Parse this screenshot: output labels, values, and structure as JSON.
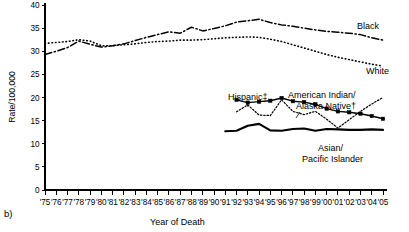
{
  "panel": {
    "label": "b)"
  },
  "axes": {
    "y_title": "Rate/100,000",
    "x_title": "Year of Death",
    "y_ticks": [
      "0",
      "5",
      "10",
      "15",
      "20",
      "25",
      "30",
      "35",
      "40"
    ],
    "x_ticks": [
      "'75",
      "'76",
      "'77",
      "'78",
      "'79",
      "'80",
      "'81",
      "'82",
      "'83",
      "'84",
      "'85",
      "'86",
      "'87",
      "'88",
      "'89",
      "'90",
      "'91",
      "'92",
      "'93",
      "'94",
      "'95",
      "'96",
      "'97",
      "'98",
      "'99",
      "'00",
      "'01",
      "'02",
      "'03",
      "'04",
      "'05"
    ]
  },
  "labels": {
    "black": "Black",
    "white": "White",
    "hispanic": "Hispanic‡",
    "aian_line1": "American Indian/",
    "aian_line2": "Alaska Native†",
    "api_line1": "Asian/",
    "api_line2": "Pacific Islander"
  },
  "colors": {
    "ink": "#000000",
    "background": "#ffffff"
  },
  "chart_data": {
    "type": "line",
    "title": "",
    "xlabel": "Year of Death",
    "ylabel": "Rate/100,000",
    "xlim": [
      1975,
      2005
    ],
    "ylim": [
      0,
      40
    ],
    "yticks": [
      0,
      5,
      10,
      15,
      20,
      25,
      30,
      35,
      40
    ],
    "grid": false,
    "legend": "inline-annotations",
    "x": [
      1975,
      1976,
      1977,
      1978,
      1979,
      1980,
      1981,
      1982,
      1983,
      1984,
      1985,
      1986,
      1987,
      1988,
      1989,
      1990,
      1991,
      1992,
      1993,
      1994,
      1995,
      1996,
      1997,
      1998,
      1999,
      2000,
      2001,
      2002,
      2003,
      2004,
      2005
    ],
    "series": [
      {
        "name": "Black",
        "style": "dash-dot",
        "markers": false,
        "values": [
          29.3,
          30.0,
          30.8,
          32.2,
          31.5,
          30.9,
          31.2,
          31.6,
          32.3,
          33.0,
          33.6,
          34.2,
          33.9,
          35.2,
          34.4,
          34.9,
          35.5,
          36.3,
          36.6,
          36.9,
          36.2,
          35.7,
          35.4,
          35.0,
          34.6,
          34.3,
          34.1,
          33.9,
          33.6,
          32.9,
          32.4
        ]
      },
      {
        "name": "White",
        "style": "dotted",
        "markers": false,
        "values": [
          31.7,
          31.9,
          32.1,
          32.5,
          32.2,
          31.2,
          31.2,
          31.4,
          31.6,
          31.9,
          32.1,
          32.2,
          32.4,
          32.4,
          32.5,
          32.7,
          32.9,
          33.0,
          33.1,
          33.0,
          32.6,
          32.1,
          31.4,
          30.7,
          30.0,
          29.3,
          28.7,
          28.2,
          27.7,
          27.2,
          26.8
        ]
      },
      {
        "name": "Hispanic‡",
        "style": "solid-markers",
        "markers": true,
        "start_year": 1992,
        "values": [
          null,
          null,
          null,
          null,
          null,
          null,
          null,
          null,
          null,
          null,
          null,
          null,
          null,
          null,
          null,
          null,
          null,
          19.5,
          18.9,
          19.1,
          19.3,
          19.9,
          19.2,
          19.0,
          18.5,
          17.6,
          17.0,
          16.8,
          16.5,
          16.0,
          15.4
        ]
      },
      {
        "name": "American Indian/Alaska Native†",
        "style": "fine-dotted",
        "markers": false,
        "start_year": 1992,
        "values": [
          null,
          null,
          null,
          null,
          null,
          null,
          null,
          null,
          null,
          null,
          null,
          null,
          null,
          null,
          null,
          null,
          null,
          16.9,
          18.4,
          16.2,
          16.1,
          19.5,
          17.0,
          16.3,
          17.0,
          15.3,
          13.4,
          15.2,
          17.0,
          18.6,
          20.0
        ]
      },
      {
        "name": "Asian/Pacific Islander",
        "style": "solid-thick",
        "markers": false,
        "start_year": 1991,
        "values": [
          null,
          null,
          null,
          null,
          null,
          null,
          null,
          null,
          null,
          null,
          null,
          null,
          null,
          null,
          null,
          null,
          12.7,
          12.8,
          13.9,
          14.3,
          12.9,
          12.8,
          13.2,
          13.3,
          12.8,
          13.2,
          13.1,
          13.0,
          13.0,
          13.1,
          13.0
        ]
      }
    ]
  }
}
